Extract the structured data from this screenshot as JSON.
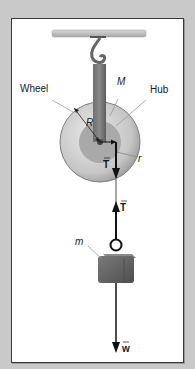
{
  "diagram": {
    "type": "pulley-free-body",
    "labels": {
      "wheel": "Wheel",
      "hub": "Hub",
      "wheel_mass": "M",
      "wheel_radius": "R",
      "hub_radius": "r",
      "tension_on_wheel": "T",
      "tension_on_block": "T",
      "block_mass": "m",
      "weight": "w"
    },
    "vector_marks": {
      "tension_on_wheel": "→",
      "tension_on_block": "→",
      "weight": "→"
    },
    "colors": {
      "background": "#c9c9c9",
      "panel": "#ffffff",
      "wheel": "#cfcfcf",
      "hub": "#a9a9a9",
      "block": "#6a6a6a",
      "ceiling": "#bdbdbd",
      "arrow": "#111111"
    }
  }
}
